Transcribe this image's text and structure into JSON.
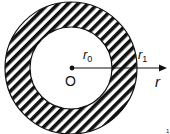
{
  "diagram": {
    "center_label": "O",
    "inner_radius_label": {
      "base": "r",
      "sub": "0"
    },
    "outer_radius_label": {
      "base": "r",
      "sub": "1"
    },
    "axis_label": "r",
    "corner_mark": "1",
    "colors": {
      "ink": "#111111",
      "background": "#ffffff"
    }
  }
}
